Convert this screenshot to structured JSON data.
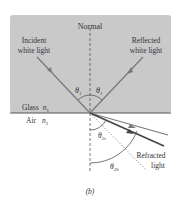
{
  "diagram": {
    "normal_label": "Normal",
    "incident_label_1": "Incident",
    "incident_label_2": "white light",
    "reflected_label_1": "Reflected",
    "reflected_label_2": "white light",
    "theta1_left": "θ",
    "theta1_left_sub": "1",
    "theta1_right": "θ",
    "theta1_right_sub": "1",
    "glass_label": "Glass",
    "glass_n": "n",
    "glass_n_sub": "1",
    "air_label": "Air",
    "air_n": "n",
    "air_n_sub": "2",
    "theta2r": "θ",
    "theta2r_sub": "2r",
    "theta2b": "θ",
    "theta2b_sub": "2b",
    "refracted_label_1": "Refracted",
    "refracted_label_2": "light",
    "caption": "(b)"
  },
  "colors": {
    "glass": "#c9c9c9",
    "interface": "#555555",
    "ray": "#7a7a7a",
    "blue_ray": "#444444",
    "text": "#333333"
  }
}
